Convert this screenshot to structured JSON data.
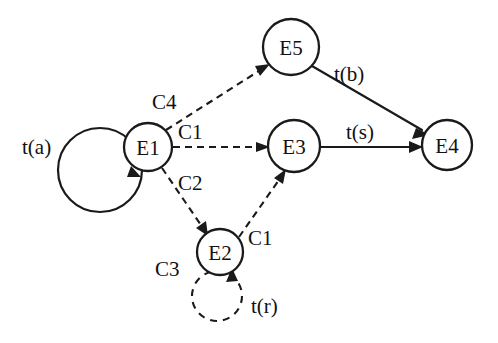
{
  "diagram": {
    "type": "state-transition-diagram",
    "background_color": "#ffffff",
    "stroke_color": "#1a1a1a",
    "nodes": [
      {
        "id": "E1",
        "label": "E1",
        "cx": 148,
        "cy": 147,
        "r": 24
      },
      {
        "id": "E2",
        "label": "E2",
        "cx": 220,
        "cy": 252,
        "r": 23
      },
      {
        "id": "E3",
        "label": "E3",
        "cx": 294,
        "cy": 146,
        "r": 26
      },
      {
        "id": "E4",
        "label": "E4",
        "cx": 447,
        "cy": 145,
        "r": 25
      },
      {
        "id": "E5",
        "label": "E5",
        "cx": 291,
        "cy": 47,
        "r": 28
      }
    ],
    "edges": [
      {
        "id": "e-a-loop",
        "from": "E1",
        "to": "E1",
        "label": "t(a)",
        "style": "solid",
        "kind": "self-loop"
      },
      {
        "id": "e-c4",
        "from": "E1",
        "to": "E5",
        "label": "C4",
        "style": "dashed",
        "kind": "line"
      },
      {
        "id": "e-c1-e1-e3",
        "from": "E1",
        "to": "E3",
        "label": "C1",
        "style": "dashed",
        "kind": "line"
      },
      {
        "id": "e-c2",
        "from": "E1",
        "to": "E2",
        "label": "C2",
        "style": "dashed",
        "kind": "line"
      },
      {
        "id": "e-c1-e2-e3",
        "from": "E2",
        "to": "E3",
        "label": "C1",
        "style": "dashed",
        "kind": "line"
      },
      {
        "id": "e-c3-loop",
        "from": "E2",
        "to": "E2",
        "label": "C3",
        "style": "dashed",
        "kind": "self-loop"
      },
      {
        "id": "e-r-loop",
        "from": "E2",
        "to": "E2",
        "label": "t(r)",
        "style": "dashed",
        "kind": "self-loop"
      },
      {
        "id": "e-b",
        "from": "E5",
        "to": "E4",
        "label": "t(b)",
        "style": "solid",
        "kind": "line"
      },
      {
        "id": "e-s",
        "from": "E3",
        "to": "E4",
        "label": "t(s)",
        "style": "solid",
        "kind": "line"
      }
    ],
    "labels": {
      "t_a": "t(a)",
      "c4": "C4",
      "c1_upper": "C1",
      "c2": "C2",
      "c1_lower": "C1",
      "c3": "C3",
      "t_r": "t(r)",
      "t_b": "t(b)",
      "t_s": "t(s)"
    },
    "node_labels": {
      "e1": "E1",
      "e2": "E2",
      "e3": "E3",
      "e4": "E4",
      "e5": "E5"
    }
  }
}
